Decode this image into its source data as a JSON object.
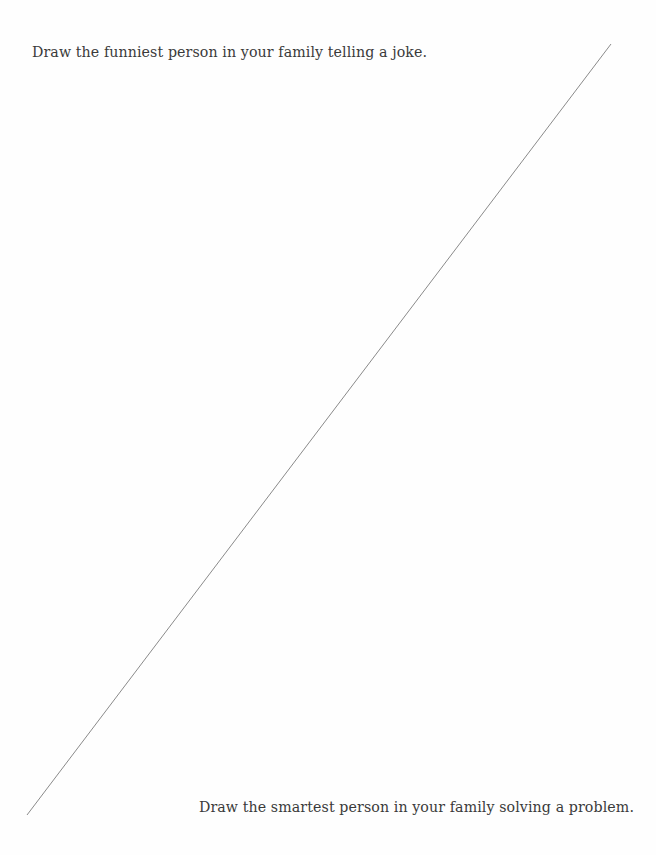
{
  "page": {
    "top_prompt": "Draw the funniest person in your family telling a joke.",
    "bottom_prompt": "Draw the smartest person in your family solving a problem.",
    "divider": {
      "x1": 611,
      "y1": 44,
      "x2": 27,
      "y2": 815,
      "color": "#8a8a8a"
    }
  }
}
